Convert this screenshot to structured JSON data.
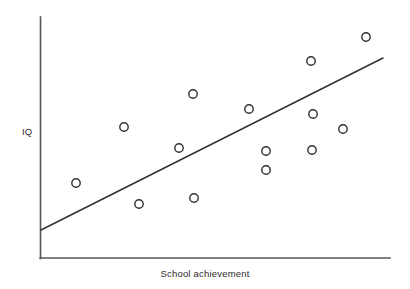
{
  "chart_data": {
    "type": "scatter",
    "title": "",
    "xlabel": "School achievement",
    "ylabel": "IQ",
    "grid": false,
    "legend": null,
    "axis_ticks": {
      "x": [],
      "y": []
    },
    "xlim": [
      0,
      100
    ],
    "ylim": [
      0,
      100
    ],
    "marker": {
      "shape": "open-circle",
      "radius_px": 4.2,
      "stroke": "#2f2f2f",
      "stroke_width": 1.4,
      "fill": "none"
    },
    "points": [
      {
        "x": 10.4,
        "y": 31.5,
        "px": 76,
        "py": 183
      },
      {
        "x": 24.0,
        "y": 54.0,
        "px": 124,
        "py": 127
      },
      {
        "x": 28.4,
        "y": 45.4,
        "px": 179,
        "py": 148
      },
      {
        "x": 28.6,
        "y": 22.7,
        "px": 139,
        "py": 204
      },
      {
        "x": 44.0,
        "y": 25.2,
        "px": 194,
        "py": 198
      },
      {
        "x": 43.8,
        "y": 68.1,
        "px": 193,
        "py": 94
      },
      {
        "x": 59.8,
        "y": 61.8,
        "px": 249,
        "py": 109
      },
      {
        "x": 64.6,
        "y": 44.4,
        "px": 266,
        "py": 151
      },
      {
        "x": 64.6,
        "y": 36.5,
        "px": 266,
        "py": 170
      },
      {
        "x": 78.1,
        "y": 59.8,
        "px": 313,
        "py": 114
      },
      {
        "x": 78.0,
        "y": 44.8,
        "px": 312,
        "py": 150
      },
      {
        "x": 86.5,
        "y": 53.5,
        "px": 343,
        "py": 129
      },
      {
        "x": 78.5,
        "y": 88.0,
        "px": 311,
        "py": 61
      },
      {
        "x": 94.2,
        "y": 98.0,
        "px": 366,
        "py": 37
      }
    ],
    "trend_line": {
      "type": "linear-regression",
      "stroke": "#2f2f2f",
      "stroke_width": 1.4,
      "start_px": {
        "x": 41,
        "y": 230
      },
      "end_px": {
        "x": 383,
        "y": 58
      }
    },
    "axes": {
      "stroke": "#555555",
      "stroke_width": 1.6,
      "y_axis_px": {
        "x": 40,
        "y_top": 17,
        "y_bottom": 258
      },
      "x_axis_px": {
        "y": 258,
        "x_left": 40,
        "x_right": 390
      }
    }
  }
}
